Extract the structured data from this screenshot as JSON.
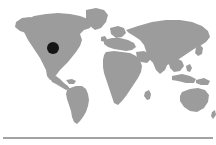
{
  "widget": {
    "name": "world-map-location-widget",
    "background_color": "#ffffff",
    "width": 216,
    "height": 145
  },
  "map": {
    "name": "world-map",
    "projection": "equirectangular",
    "land_color": "#9c9c9c",
    "ocean_color": "#ffffff",
    "regions": [
      "north-america",
      "south-america",
      "greenland",
      "europe",
      "africa",
      "asia",
      "australia",
      "new-zealand",
      "indonesia",
      "japan",
      "british-isles",
      "madagascar"
    ]
  },
  "marker": {
    "name": "location-marker",
    "shape": "circle",
    "color": "#151515",
    "radius_px": 6,
    "x_px": 53,
    "y_px": 48,
    "region_label": "North America"
  },
  "divider": {
    "name": "horizontal-divider",
    "color": "#a3a3a3",
    "y_px": 137,
    "thickness_px": 2
  }
}
